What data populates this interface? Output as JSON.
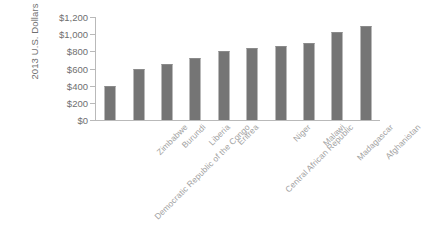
{
  "chart_data": {
    "type": "bar",
    "title": "",
    "subtitle": "",
    "xlabel": "",
    "ylabel": "2013 U.S. Dollars",
    "ylim": [
      0,
      1200
    ],
    "ytick_step": 200,
    "ytick_labels": [
      "$1,200",
      "$1,000",
      "$800",
      "$600",
      "$400",
      "$200",
      "$0"
    ],
    "ytick_values": [
      1200,
      1000,
      800,
      600,
      400,
      200,
      0
    ],
    "grid": false,
    "legend": false,
    "legend_position": "none",
    "bar_color": "#757575",
    "axis_color": "#b9b9b9",
    "label_color": "#a2a2a2",
    "categories": [
      "Democratic Republic of the Congo",
      "Zimbabwe",
      "Burundi",
      "Liberia",
      "Eritrea",
      "Central African Republic",
      "Niger",
      "Malawi",
      "Madagascar",
      "Afghanistan"
    ],
    "values": [
      400,
      590,
      650,
      720,
      800,
      840,
      860,
      900,
      1030,
      1100
    ],
    "series": [
      {
        "name": "2013 U.S. Dollars",
        "values": [
          400,
          590,
          650,
          720,
          800,
          840,
          860,
          900,
          1030,
          1100
        ]
      }
    ]
  }
}
